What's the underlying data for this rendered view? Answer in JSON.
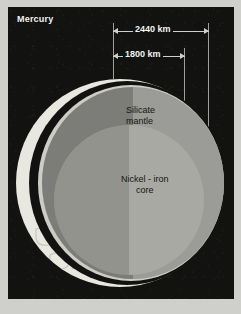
{
  "title": "Mercury",
  "dimensions": [
    {
      "name": "outer-diameter",
      "label": "2440 km"
    },
    {
      "name": "core-diameter",
      "label": "1800 km"
    }
  ],
  "layers": {
    "mantle": {
      "line1": "Silicate",
      "line2": "mantle"
    },
    "core": {
      "line1": "Nickel - iron",
      "line2": "core"
    }
  },
  "colors": {
    "panel_background": "#121211",
    "mat": "#cfcfcb",
    "surface_crust": "#e8e7e0",
    "mantle": "#9b9b97",
    "mantle_rim": "#cdccc5",
    "core": "#a9a9a4",
    "annotation": "#f2f2f0"
  }
}
